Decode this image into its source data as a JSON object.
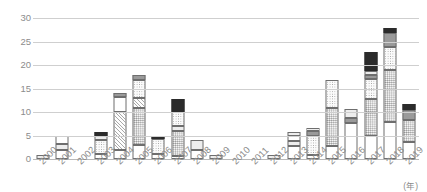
{
  "chart_data": {
    "type": "bar",
    "stacked": true,
    "title": "",
    "xlabel": "(年)",
    "ylabel": "",
    "ylim": [
      0,
      30
    ],
    "yticks": [
      0,
      5,
      10,
      15,
      20,
      25,
      30
    ],
    "grid": true,
    "legend": "none",
    "categories": [
      "2000",
      "2001",
      "2002",
      "2003",
      "2004",
      "2005",
      "2006",
      "2007",
      "2008",
      "2009",
      "2010",
      "2011",
      "2012",
      "2013",
      "2014",
      "2015",
      "2016",
      "2017",
      "2018",
      "2019"
    ],
    "totals": [
      0.8,
      5.0,
      0,
      5.8,
      14.0,
      17.8,
      4.8,
      12.8,
      4.0,
      0.8,
      0,
      0,
      0.8,
      5.8,
      6.7,
      16.8,
      10.7,
      22.7,
      27.8,
      11.8
    ],
    "stacks": [
      [
        {
          "fill": "light",
          "value": 0.8
        }
      ],
      [
        {
          "fill": "white",
          "value": 2.0
        },
        {
          "fill": "light",
          "value": 1.1
        },
        {
          "fill": "white",
          "value": 1.9
        }
      ],
      [],
      [
        {
          "fill": "white",
          "value": 1.0
        },
        {
          "fill": "dot",
          "value": 3.0
        },
        {
          "fill": "light",
          "value": 1.0
        },
        {
          "fill": "dark",
          "value": 0.8
        }
      ],
      [
        {
          "fill": "white",
          "value": 1.9
        },
        {
          "fill": "hatch",
          "value": 8.2
        },
        {
          "fill": "white",
          "value": 3.2
        },
        {
          "fill": "mid",
          "value": 0.7
        }
      ],
      [
        {
          "fill": "white",
          "value": 3.0
        },
        {
          "fill": "dot-dense",
          "value": 7.8
        },
        {
          "fill": "hatch",
          "value": 2.1
        },
        {
          "fill": "dot",
          "value": 4.0
        },
        {
          "fill": "mid",
          "value": 0.9
        }
      ],
      [
        {
          "fill": "white",
          "value": 1.0
        },
        {
          "fill": "dot",
          "value": 3.3
        },
        {
          "fill": "dark",
          "value": 0.5
        }
      ],
      [
        {
          "fill": "white",
          "value": 0.7
        },
        {
          "fill": "dot-dense",
          "value": 5.3
        },
        {
          "fill": "light",
          "value": 1.0
        },
        {
          "fill": "dot",
          "value": 3.0
        },
        {
          "fill": "dark",
          "value": 2.8
        }
      ],
      [
        {
          "fill": "white",
          "value": 2.0
        },
        {
          "fill": "light",
          "value": 2.0
        }
      ],
      [
        {
          "fill": "light",
          "value": 0.8
        }
      ],
      [],
      [],
      [
        {
          "fill": "light",
          "value": 0.8
        }
      ],
      [
        {
          "fill": "white",
          "value": 2.7
        },
        {
          "fill": "light",
          "value": 1.2
        },
        {
          "fill": "white",
          "value": 0.9
        },
        {
          "fill": "light",
          "value": 1.0
        }
      ],
      [
        {
          "fill": "white",
          "value": 0.8
        },
        {
          "fill": "dot",
          "value": 4.2
        },
        {
          "fill": "mid",
          "value": 1.0
        },
        {
          "fill": "light",
          "value": 0.7
        }
      ],
      [
        {
          "fill": "white",
          "value": 2.7
        },
        {
          "fill": "dot-dense",
          "value": 8.1
        },
        {
          "fill": "dot",
          "value": 6.0
        }
      ],
      [
        {
          "fill": "white",
          "value": 7.6
        },
        {
          "fill": "mid",
          "value": 1.2
        },
        {
          "fill": "light",
          "value": 1.9
        }
      ],
      [
        {
          "fill": "white",
          "value": 4.8
        },
        {
          "fill": "dot-dense",
          "value": 8.0
        },
        {
          "fill": "dot",
          "value": 4.2
        },
        {
          "fill": "mid",
          "value": 0.8
        },
        {
          "fill": "light",
          "value": 1.0
        },
        {
          "fill": "dark",
          "value": 3.9
        }
      ],
      [
        {
          "fill": "white",
          "value": 7.8
        },
        {
          "fill": "dot-dense",
          "value": 11.1
        },
        {
          "fill": "dot",
          "value": 5.0
        },
        {
          "fill": "mid",
          "value": 2.9
        },
        {
          "fill": "dark",
          "value": 1.0
        }
      ],
      [
        {
          "fill": "white",
          "value": 3.7
        },
        {
          "fill": "dot-dense",
          "value": 4.7
        },
        {
          "fill": "mid",
          "value": 2.1
        },
        {
          "fill": "dark",
          "value": 1.3
        }
      ]
    ]
  },
  "axis": {
    "unit_label": "(年)"
  },
  "colors": {
    "gridline": "#cfcfcf",
    "tick_text": "#8c8c8c",
    "bar_outline": "#6e6e6e",
    "fill_dark": "#2b2b2b",
    "fill_mid": "#9a9a9a",
    "fill_light": "#ededed",
    "fill_white": "#ffffff"
  }
}
